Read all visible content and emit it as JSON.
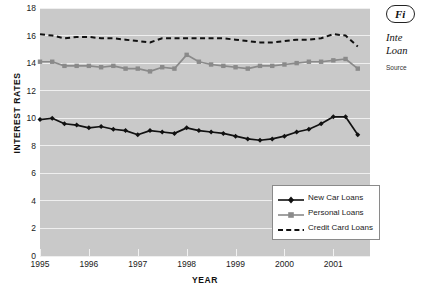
{
  "figure": {
    "pill_label": "Fi",
    "title_line1": "Inte",
    "title_line2": "Loan",
    "source_label": "Source"
  },
  "axes": {
    "y_title": "INTEREST RATES",
    "x_title": "YEAR",
    "y_ticks": [
      "0",
      "2",
      "4",
      "6",
      "8",
      "10",
      "12",
      "14",
      "16",
      "18"
    ],
    "x_ticks": [
      "1995",
      "1996",
      "1997",
      "1998",
      "1999",
      "2000",
      "2001"
    ]
  },
  "legend": {
    "items": [
      {
        "label": "New Car Loans",
        "marker": "diamond",
        "style": "solid",
        "color": "#111111"
      },
      {
        "label": "Personal Loans",
        "marker": "square",
        "style": "solid",
        "color": "#8a8a8a"
      },
      {
        "label": "Credit Card Loans",
        "marker": "none",
        "style": "dashed",
        "color": "#111111"
      }
    ]
  },
  "colors": {
    "plot_background": "#c9c9c9",
    "gridline": "#efefef",
    "new_car": "#111111",
    "personal": "#8a8a8a",
    "credit_card": "#111111"
  },
  "chart_data": {
    "type": "line",
    "xlabel": "YEAR",
    "ylabel": "INTEREST RATES",
    "xlim": [
      1995,
      2001.75
    ],
    "ylim": [
      0,
      18
    ],
    "grid": true,
    "legend_position": "bottom-right",
    "x": [
      1995.0,
      1995.25,
      1995.5,
      1995.75,
      1996.0,
      1996.25,
      1996.5,
      1996.75,
      1997.0,
      1997.25,
      1997.5,
      1997.75,
      1998.0,
      1998.25,
      1998.5,
      1998.75,
      1999.0,
      1999.25,
      1999.5,
      1999.75,
      2000.0,
      2000.25,
      2000.5,
      2000.75,
      2001.0,
      2001.25,
      2001.5
    ],
    "series": [
      {
        "name": "New Car Loans",
        "values": [
          9.9,
          10.0,
          9.6,
          9.5,
          9.3,
          9.4,
          9.2,
          9.1,
          8.8,
          9.1,
          9.0,
          8.9,
          9.3,
          9.1,
          9.0,
          8.9,
          8.7,
          8.5,
          8.4,
          8.5,
          8.7,
          9.0,
          9.2,
          9.6,
          10.1,
          10.1,
          8.8
        ]
      },
      {
        "name": "Personal Loans",
        "values": [
          14.1,
          14.1,
          13.8,
          13.8,
          13.8,
          13.7,
          13.8,
          13.6,
          13.6,
          13.4,
          13.7,
          13.6,
          14.6,
          14.1,
          13.9,
          13.8,
          13.7,
          13.6,
          13.8,
          13.8,
          13.9,
          14.0,
          14.1,
          14.1,
          14.2,
          14.3,
          13.6
        ]
      },
      {
        "name": "Credit Card Loans",
        "values": [
          16.1,
          16.0,
          15.8,
          15.9,
          15.9,
          15.8,
          15.8,
          15.7,
          15.6,
          15.5,
          15.8,
          15.8,
          15.8,
          15.8,
          15.8,
          15.8,
          15.7,
          15.6,
          15.5,
          15.5,
          15.6,
          15.7,
          15.7,
          15.8,
          16.1,
          16.0,
          15.2
        ]
      }
    ]
  }
}
